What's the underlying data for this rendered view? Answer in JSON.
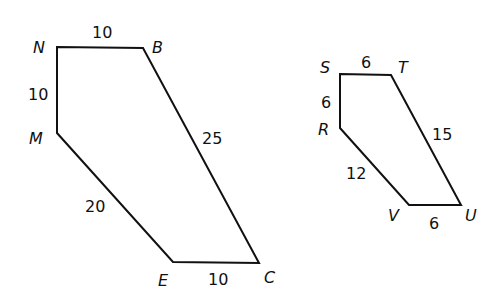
{
  "figures": [
    {
      "name": "pentagon-NBCEM",
      "vertices": {
        "N": {
          "label": "N",
          "x": 57,
          "y": 47
        },
        "B": {
          "label": "B",
          "x": 143,
          "y": 48
        },
        "C": {
          "label": "C",
          "x": 259,
          "y": 263
        },
        "E": {
          "label": "E",
          "x": 173,
          "y": 262
        },
        "M": {
          "label": "M",
          "x": 57,
          "y": 133
        }
      },
      "sides": {
        "NB": "10",
        "NM": "10",
        "BC": "25",
        "ME": "20",
        "EC": "10"
      }
    },
    {
      "name": "pentagon-STUVR",
      "vertices": {
        "S": {
          "label": "S",
          "x": 340,
          "y": 74
        },
        "T": {
          "label": "T",
          "x": 391,
          "y": 75
        },
        "U": {
          "label": "U",
          "x": 461,
          "y": 205
        },
        "V": {
          "label": "V",
          "x": 409,
          "y": 205
        },
        "R": {
          "label": "R",
          "x": 340,
          "y": 128
        }
      },
      "sides": {
        "ST": "6",
        "SR": "6",
        "TU": "15",
        "RV": "12",
        "VU": "6"
      }
    }
  ],
  "colors": {
    "stroke": "#111111",
    "background": "#ffffff"
  }
}
